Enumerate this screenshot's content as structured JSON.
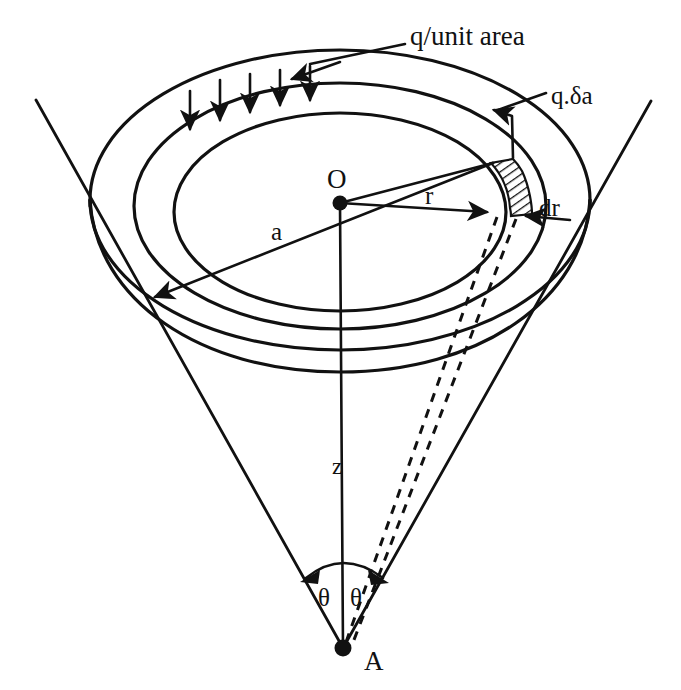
{
  "figure": {
    "background_color": "#ffffff",
    "ink_color": "#111111"
  },
  "labels": {
    "load_intensity": "q/unit area",
    "element_load": "q.δa",
    "center_point": "O",
    "radius_r": "r",
    "radius_a": "a",
    "element_width": "dr",
    "depth_axis": "z",
    "apex_point": "A",
    "angle_left": "θ",
    "angle_right": "θ"
  },
  "geometry": {
    "center": {
      "x": 340,
      "y": 203
    },
    "apex": {
      "x": 343,
      "y": 648
    },
    "top_ellipse_outer": {
      "cx": 340,
      "cy": 200,
      "rx": 250,
      "ry": 150
    },
    "top_ellipse_middle": {
      "cx": 340,
      "cy": 205,
      "rx": 205,
      "ry": 122
    },
    "top_ellipse_inner": {
      "cx": 340,
      "cy": 212,
      "rx": 165,
      "ry": 98
    },
    "disc_thickness": 60,
    "cone_half_angle_label": "θ",
    "downward_arrow_count": 5
  },
  "elements": {
    "hatched_patch_name": "ring-element-q-delta-a",
    "dashed_ray_count": 2,
    "theta_arc_present": true
  }
}
